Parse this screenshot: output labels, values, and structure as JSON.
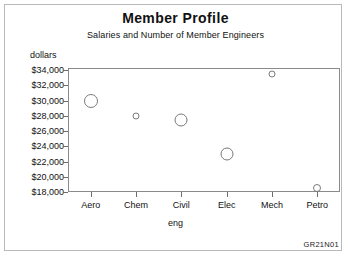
{
  "chart_data": {
    "type": "scatter",
    "title": "Member Profile",
    "subtitle": "Salaries and Number of Member Engineers",
    "xlabel": "eng",
    "ylabel": "dollars",
    "categories": [
      "Aero",
      "Chem",
      "Civil",
      "Elec",
      "Mech",
      "Petro"
    ],
    "values": [
      30000,
      28000,
      27500,
      23000,
      33500,
      18500
    ],
    "marker_sizes": [
      14,
      7,
      13,
      13,
      7,
      8
    ],
    "ylim": [
      18000,
      34000
    ],
    "ytick_labels": [
      "$34,000",
      "$32,000",
      "$30,000",
      "$28,000",
      "$26,000",
      "$24,000",
      "$22,000",
      "$20,000",
      "$18,000"
    ],
    "ytick_values": [
      34000,
      32000,
      30000,
      28000,
      26000,
      24000,
      22000,
      20000,
      18000
    ],
    "grid": false,
    "legend": "none",
    "marker_style": "open-circle",
    "points": [
      {
        "category": "Aero",
        "value": 30000,
        "size": 14
      },
      {
        "category": "Chem",
        "value": 28000,
        "size": 7
      },
      {
        "category": "Civil",
        "value": 27500,
        "size": 13
      },
      {
        "category": "Elec",
        "value": 23000,
        "size": 13
      },
      {
        "category": "Mech",
        "value": 33500,
        "size": 7
      },
      {
        "category": "Petro",
        "value": 18500,
        "size": 8
      }
    ]
  },
  "footer": {
    "code": "GR21N01"
  },
  "colors": {
    "marker_stroke": "#7a7a7a",
    "axis": "#8a8a8a",
    "frame": "#b9b9b9",
    "text": "#111111"
  }
}
